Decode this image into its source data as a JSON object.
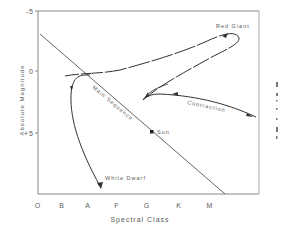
{
  "diagram": {
    "type": "Hertzsprung-Russell diagram with stellar evolution track",
    "y_axis": {
      "label": "Absolute Magnitude",
      "ticks": [
        {
          "label": "-5",
          "value": -5
        },
        {
          "label": "0",
          "value": 0
        },
        {
          "label": "+5",
          "value": 5
        }
      ]
    },
    "x_axis": {
      "label": "Spectral Class",
      "ticks": [
        "O",
        "B",
        "A",
        "F",
        "G",
        "K",
        "M"
      ]
    },
    "annotations": {
      "red_giant": "Red Giant",
      "main_sequence": "Main Sequence",
      "contraction": "Contraction",
      "sun": "Sun",
      "white_dwarf": "White Dwarf"
    },
    "colors": {
      "line": "#444444",
      "axis": "#777777",
      "text": "#5a5a5a",
      "background": "#ffffff"
    }
  }
}
